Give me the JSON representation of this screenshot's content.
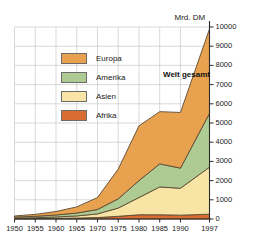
{
  "figure": {
    "unit_label": "Mrd. DM",
    "annotation": "Welt gesamt",
    "ghost_title": ""
  },
  "legend": {
    "items": [
      {
        "label": "Europa",
        "color": "#e8a14f"
      },
      {
        "label": "Amerika",
        "color": "#aecb93"
      },
      {
        "label": "Asien",
        "color": "#f8e5a6"
      },
      {
        "label": "Afrika",
        "color": "#d96c33"
      }
    ]
  },
  "chart_data": {
    "type": "area",
    "stacked": true,
    "title": "",
    "subtitle": "",
    "xlabel": "",
    "ylabel": "Mrd. DM",
    "annotations": [
      "Welt gesamt"
    ],
    "grid": true,
    "legend_position": "inside-upper-left",
    "x": [
      1950,
      1955,
      1960,
      1965,
      1970,
      1975,
      1980,
      1985,
      1990,
      1997
    ],
    "xlim": [
      1950,
      1997
    ],
    "xticklabels": [
      "1950",
      "1955",
      "1960",
      "1965",
      "1970",
      "1975",
      "1980",
      "1985",
      "1990",
      "1997"
    ],
    "ylim": [
      0,
      10000
    ],
    "yticks": [
      0,
      1000,
      2000,
      3000,
      4000,
      5000,
      6000,
      7000,
      8000,
      9000,
      10000
    ],
    "yticklabels": [
      "0",
      "1000",
      "2000",
      "3000",
      "4000",
      "5000",
      "6000",
      "7000",
      "8000",
      "9000",
      "10000"
    ],
    "series": [
      {
        "name": "Afrika",
        "color": "#d96c33",
        "values": [
          20,
          25,
          35,
          50,
          75,
          140,
          220,
          220,
          200,
          250
        ]
      },
      {
        "name": "Asien",
        "color": "#f8e5a6",
        "values": [
          25,
          40,
          70,
          110,
          190,
          430,
          900,
          1450,
          1400,
          2450
        ]
      },
      {
        "name": "Amerika",
        "color": "#aecb93",
        "values": [
          55,
          75,
          105,
          150,
          230,
          480,
          880,
          1200,
          1050,
          2800
        ]
      },
      {
        "name": "Europa",
        "color": "#e8a14f",
        "values": [
          60,
          100,
          180,
          320,
          620,
          1550,
          2850,
          2720,
          2900,
          4400
        ]
      }
    ],
    "totals": [
      160,
      240,
      390,
      630,
      1115,
      2600,
      4850,
      5590,
      5550,
      9900
    ]
  }
}
